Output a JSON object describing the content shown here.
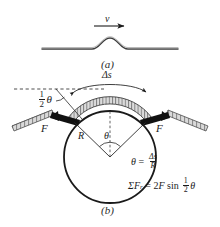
{
  "figure": {
    "panel_a": {
      "caption": "(a)",
      "velocity_label": "v",
      "arrow_icon": "right-arrow-icon",
      "description": "straight rope with a single travelling pulse hump"
    },
    "panel_b": {
      "caption": "(b)",
      "arc_length_label": "Δs",
      "half_angle_label_num": "1",
      "half_angle_label_den": "2",
      "half_angle_symbol": "θ",
      "radius_label": "R",
      "center_angle_label": "θ",
      "force_left_label": "F",
      "force_right_label": "F",
      "equations": [
        {
          "id": "theta-equation",
          "lhs": "θ",
          "relation": "=",
          "numerator": "Δs",
          "denominator": "R"
        },
        {
          "id": "sum-forces-equation",
          "lhs_sigma": "Σ",
          "lhs_symbol": "F",
          "lhs_subscript": "r",
          "relation": "=",
          "coefficient": "2",
          "force_symbol": "F",
          "function": "sin",
          "half_num": "1",
          "half_den": "2",
          "angle_symbol": "θ"
        }
      ]
    },
    "colors": {
      "ink": "#1c1c1c",
      "rope_fill": "#d8d8d8",
      "rope_dark": "#101010",
      "circle_stroke": "#1a1a1a",
      "dash_stroke": "#3a3a3a",
      "paper": "#ffffff"
    }
  }
}
